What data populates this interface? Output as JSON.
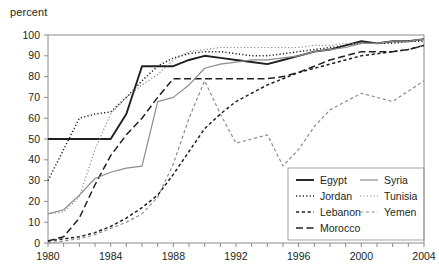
{
  "chart_data": {
    "type": "line",
    "title": "",
    "subtitle": "",
    "unit_label": "percent",
    "xlabel": "",
    "ylabel": "",
    "xlim": [
      1980,
      2004
    ],
    "ylim": [
      0,
      100
    ],
    "grid": false,
    "legend_position": "bottom-right",
    "y_ticks": [
      0,
      10,
      20,
      30,
      40,
      50,
      60,
      70,
      80,
      90,
      100
    ],
    "y_tick_labels": [
      "0",
      "10",
      "20",
      "30",
      "40",
      "50",
      "60",
      "70",
      "80",
      "90",
      "100"
    ],
    "x_ticks": [
      1980,
      1981,
      1982,
      1983,
      1984,
      1985,
      1986,
      1987,
      1988,
      1989,
      1990,
      1991,
      1992,
      1993,
      1994,
      1995,
      1996,
      1997,
      1998,
      1999,
      2000,
      2001,
      2002,
      2003,
      2004
    ],
    "x_tick_labels_shown": [
      "1980",
      "1984",
      "1988",
      "1992",
      "1996",
      "2000",
      "2004"
    ],
    "x_label_years": [
      1980,
      1984,
      1988,
      1992,
      1996,
      2000,
      2004
    ],
    "x": [
      1980,
      1981,
      1982,
      1983,
      1984,
      1985,
      1986,
      1987,
      1988,
      1989,
      1990,
      1991,
      1992,
      1993,
      1994,
      1995,
      1996,
      1997,
      1998,
      1999,
      2000,
      2001,
      2002,
      2003,
      2004
    ],
    "series": [
      {
        "name": "Egypt",
        "color": "#231f20",
        "style": "solid",
        "values": [
          50,
          50,
          50,
          50,
          50,
          62,
          85,
          85,
          85,
          88,
          90,
          89,
          88,
          87,
          86,
          88,
          90,
          92,
          93,
          95,
          97,
          96,
          97,
          97,
          98
        ]
      },
      {
        "name": "Jordan",
        "color": "#231f20",
        "style": "dotted",
        "values": [
          30,
          45,
          60,
          62,
          63,
          70,
          78,
          85,
          89,
          91,
          92,
          92,
          91,
          90,
          90,
          91,
          92,
          93,
          94,
          95,
          96,
          96,
          96,
          97,
          97
        ]
      },
      {
        "name": "Lebanon",
        "color": "#231f20",
        "style": "dashed",
        "values": [
          1,
          2,
          3,
          5,
          8,
          12,
          17,
          23,
          33,
          44,
          55,
          62,
          68,
          72,
          76,
          79,
          82,
          84,
          86,
          88,
          90,
          91,
          92,
          93,
          95
        ]
      },
      {
        "name": "Morocco",
        "color": "#231f20",
        "style": "longdash",
        "values": [
          1,
          3,
          12,
          28,
          42,
          52,
          60,
          70,
          79,
          79,
          79,
          79,
          79,
          79,
          79,
          80,
          82,
          85,
          88,
          90,
          92,
          92,
          92,
          93,
          95
        ]
      },
      {
        "name": "Syria",
        "color": "#8c8c8c",
        "style": "solid",
        "values": [
          14,
          16,
          23,
          31,
          34,
          36,
          37,
          68,
          70,
          76,
          84,
          86,
          87,
          88,
          88,
          89,
          90,
          92,
          93,
          94,
          96,
          96,
          97,
          97,
          98
        ]
      },
      {
        "name": "Tunisia",
        "color": "#8c8c8c",
        "style": "dotted",
        "values": [
          14,
          15,
          22,
          45,
          62,
          70,
          76,
          81,
          88,
          92,
          93,
          94,
          94,
          94,
          94,
          94,
          94,
          95,
          95,
          96,
          96,
          96,
          97,
          97,
          98
        ]
      },
      {
        "name": "Yemen",
        "color": "#8c8c8c",
        "style": "dashed",
        "values": [
          0,
          1,
          2,
          4,
          7,
          10,
          14,
          22,
          38,
          60,
          78,
          62,
          48,
          50,
          52,
          37,
          45,
          56,
          64,
          68,
          72,
          70,
          68,
          73,
          78
        ]
      }
    ],
    "annotations": []
  },
  "legend": {
    "entries": [
      {
        "label": "Egypt",
        "column": 0
      },
      {
        "label": "Jordan",
        "column": 0
      },
      {
        "label": "Lebanon",
        "column": 0
      },
      {
        "label": "Morocco",
        "column": 0
      },
      {
        "label": "Syria",
        "column": 1
      },
      {
        "label": "Tunisia",
        "column": 1
      },
      {
        "label": "Yemen",
        "column": 1
      }
    ]
  }
}
